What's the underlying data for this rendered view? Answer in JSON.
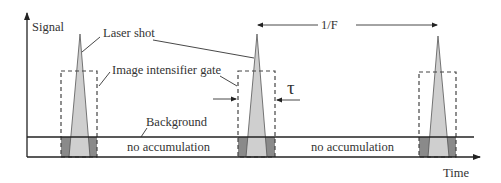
{
  "diagram": {
    "axes": {
      "y_label": "Signal",
      "x_label": "Time"
    },
    "labels": {
      "laser_shot": "Laser shot",
      "gate": "Image intensifier gate",
      "background": "Background",
      "period": "1/F",
      "gate_width": "τ",
      "no_accumulation_1": "no accumulation",
      "no_accumulation_2": "no accumulation"
    },
    "pulses": [
      {
        "peak_x": 80,
        "peak_y": 34,
        "base_left": 69,
        "base_right": 90,
        "gate_left": 61,
        "gate_right": 97,
        "gate_top": 71
      },
      {
        "peak_x": 257,
        "peak_y": 34,
        "base_left": 246,
        "base_right": 267,
        "gate_left": 238,
        "gate_right": 275,
        "gate_top": 71
      },
      {
        "peak_x": 438,
        "peak_y": 36,
        "base_left": 428,
        "base_right": 449,
        "gate_left": 419,
        "gate_right": 456,
        "gate_top": 72
      }
    ],
    "colors": {
      "line": "#222222",
      "pulse_fill": "#cfcfcf",
      "accumulated_fill": "#8a8a8a",
      "gate_dash": "#444444",
      "text": "#333333"
    }
  }
}
